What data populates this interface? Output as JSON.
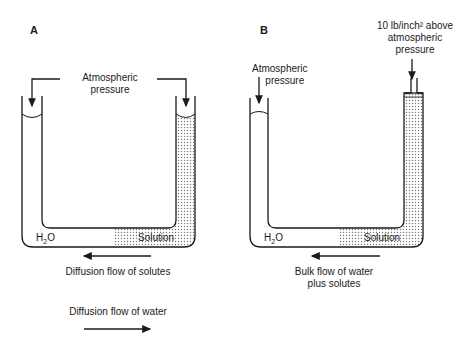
{
  "panel_a": {
    "label": "A",
    "pressure_label_line1": "Atmospheric",
    "pressure_label_line2": "pressure",
    "left_fluid": "H2O",
    "right_fluid": "Solution",
    "flow_caption": "Diffusion flow of solutes",
    "flow_direction": "left",
    "water_caption": "Diffusion flow of water",
    "water_direction": "right"
  },
  "panel_b": {
    "label": "B",
    "left_pressure_line1": "Atmospheric",
    "left_pressure_line2": "pressure",
    "right_pressure_line1": "10 lb/inch² above",
    "right_pressure_line2": "atmospheric",
    "right_pressure_line3": "pressure",
    "left_fluid": "H2O",
    "right_fluid": "Solution",
    "flow_caption_line1": "Bulk flow of water",
    "flow_caption_line2": "plus solutes",
    "flow_direction": "left"
  },
  "colors": {
    "line": "#1a1a1a",
    "fill_dots": "#888888",
    "background": "#ffffff"
  }
}
